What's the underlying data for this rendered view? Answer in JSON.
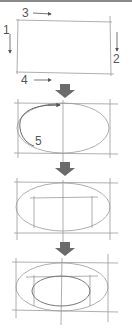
{
  "diagram": {
    "colors": {
      "pencil": "#9a9a9a",
      "dark_pencil": "#555555",
      "arrow": "#6b6b6b",
      "top_rule": "#8a8a8a"
    },
    "step1": {
      "labels": {
        "left": "1",
        "right": "2",
        "top": "3",
        "bottom": "4"
      }
    },
    "step2": {
      "label": "5"
    },
    "arrows": [
      {
        "name": "down-arrow-1",
        "y": 84
      },
      {
        "name": "down-arrow-2",
        "y": 162
      },
      {
        "name": "down-arrow-3",
        "y": 242
      }
    ]
  }
}
